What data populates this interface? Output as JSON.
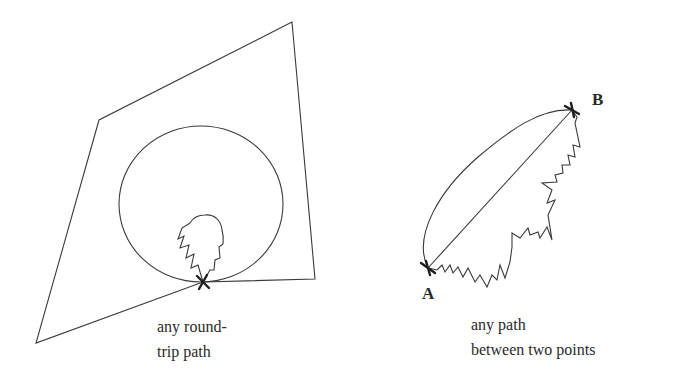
{
  "colors": {
    "background": "#ffffff",
    "stroke": "#3a3a3a",
    "text": "#2a2a2a"
  },
  "left_panel": {
    "caption_line1": "any round-",
    "caption_line2": "trip path",
    "polygon_points": "292,22 99,120 36,343 203,282 315,279",
    "circle": {
      "cx": 201,
      "cy": 204,
      "rx": 82,
      "ry": 78
    },
    "loop_points": "203,282 198,265 191,268 194,254 186,258 189,245 180,248 184,236 178,239 182,228 190,223",
    "loop_arc_path": "M190,223 C194,216 200,215 205,215 C214,214 221,220 222,230 C224,237 223,241 223,244",
    "loop_points_right": "223,244 219,247 220,258 215,260 214,270 210,270 203,282",
    "marker": {
      "x": 203,
      "y": 282
    }
  },
  "right_panel": {
    "caption_line1": "any path",
    "caption_line2": "between two points",
    "point_a_label": "A",
    "point_b_label": "B",
    "point_a": {
      "x": 428,
      "y": 268
    },
    "point_b": {
      "x": 572,
      "y": 110
    },
    "curved_path": "M428,268 C412,236 440,190 478,157 C510,130 540,108 572,110",
    "straight_path": "M428,268 L572,110",
    "zigzag_points": "428,268 437,270 442,265 445,272 450,265 453,273 458,267 463,277 468,268 475,282 480,275 487,287 492,275 497,280 500,265 505,278 510,262 512,247 512,233 520,238 528,228 530,235 538,232 540,238 547,227 552,240 548,215 555,200 547,203 552,190 542,183 557,182 555,175 563,173 562,165 570,165 568,155 575,157 573,145 580,147 575,123 577,117 572,110"
  }
}
